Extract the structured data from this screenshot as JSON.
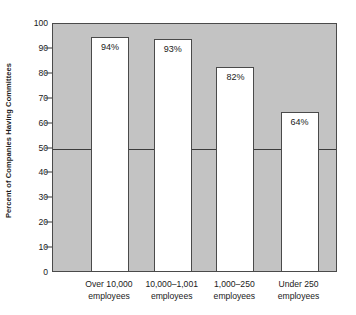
{
  "chart_data": {
    "type": "bar",
    "title": "",
    "xlabel": "",
    "ylabel": "Percent of Companies Having Committees",
    "categories": [
      "Over 10,000 employees",
      "10,000–1,001 employees",
      "1,000–250 employees",
      "Under 250 employees"
    ],
    "category_lines": [
      {
        "line1": "Over 10,000",
        "line2": "employees"
      },
      {
        "line1": "10,000–1,001",
        "line2": "employees"
      },
      {
        "line1": "1,000–250",
        "line2": "employees"
      },
      {
        "line1": "Under 250",
        "line2": "employees"
      }
    ],
    "values": [
      94,
      93,
      82,
      64
    ],
    "value_labels": [
      "94%",
      "93%",
      "82%",
      "64%"
    ],
    "ylim": [
      0,
      100
    ],
    "y_ticks": [
      0,
      10,
      20,
      30,
      40,
      50,
      60,
      70,
      80,
      90,
      100
    ],
    "y_tick_labels": [
      "0",
      "10",
      "20",
      "30",
      "40",
      "50",
      "60",
      "70",
      "80",
      "90",
      "100"
    ],
    "grid": false,
    "legend": "none",
    "annotations": [
      {
        "name": "reference-line",
        "value": 50,
        "orientation": "horizontal"
      }
    ],
    "colors": {
      "plot_background": "#c3c3c3",
      "bar_fill": "#ffffff",
      "bar_outline": "#4a4a4a",
      "axis": "#3a3a3a",
      "text": "#1a1a1a",
      "page_background": "#ffffff"
    }
  }
}
